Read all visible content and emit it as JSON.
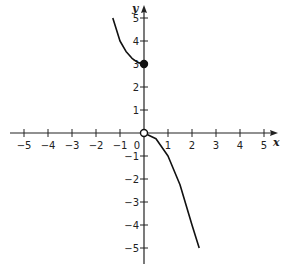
{
  "chart_data": {
    "type": "line",
    "title": "",
    "xlabel": "x",
    "ylabel": "y",
    "xlim": [
      -5.5,
      5.5
    ],
    "ylim": [
      -5.5,
      5.5
    ],
    "x_ticks": [
      -5,
      -4,
      -3,
      -2,
      -1,
      0,
      1,
      2,
      3,
      4,
      5
    ],
    "x_tick_labels": [
      "-5",
      "-4",
      "-3",
      "-2",
      "-1",
      "0",
      "1",
      "2",
      "3",
      "4",
      "5"
    ],
    "y_ticks": [
      -5,
      -4,
      -3,
      -2,
      -1,
      1,
      2,
      3,
      4,
      5
    ],
    "y_tick_labels": [
      "-5",
      "-4",
      "-3",
      "-2",
      "-1",
      "1",
      "2",
      "3",
      "4",
      "5"
    ],
    "grid": false,
    "legend": null,
    "series": [
      {
        "name": "left branch (x < 0)",
        "description": "decreasing curve approaching (0, 3), approx y = x^2 + 3",
        "x": [
          -1.3,
          -1.0,
          -0.75,
          -0.5,
          -0.25,
          0.0
        ],
        "y": [
          5.0,
          4.0,
          3.55,
          3.25,
          3.06,
          3.0
        ],
        "endpoint": {
          "x": 0,
          "y": 3,
          "style": "closed"
        }
      },
      {
        "name": "right branch (x > 0)",
        "description": "decreasing curve starting at (0, 0), approx y = -x^2",
        "x": [
          0.0,
          0.5,
          1.0,
          1.5,
          2.0,
          2.3
        ],
        "y": [
          0.0,
          -0.25,
          -1.0,
          -2.25,
          -4.0,
          -5.0
        ],
        "endpoint": {
          "x": 0,
          "y": 0,
          "style": "open"
        }
      }
    ],
    "points": [
      {
        "x": 0,
        "y": 3,
        "style": "closed"
      },
      {
        "x": 0,
        "y": 0,
        "style": "open"
      }
    ]
  },
  "labels": {
    "x_axis": "x",
    "y_axis": "y"
  }
}
